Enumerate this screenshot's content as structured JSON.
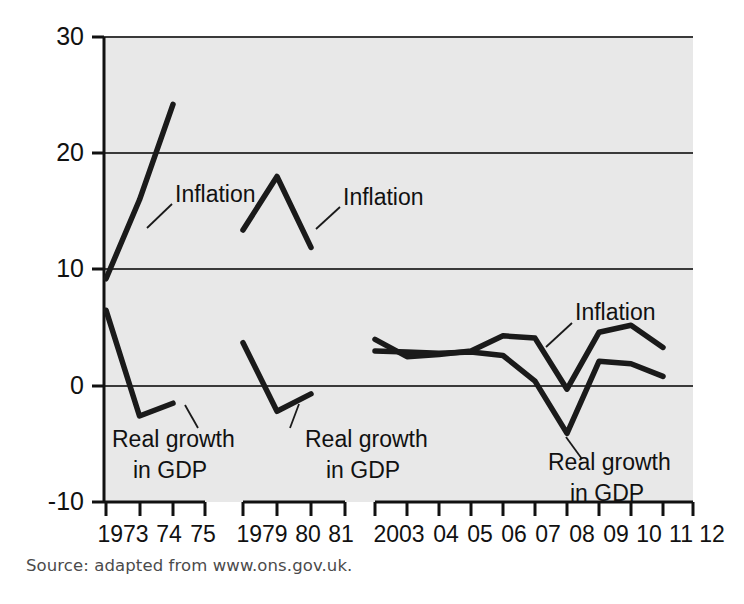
{
  "chart_data": {
    "type": "line",
    "title": "",
    "subtitle": "",
    "xlabel": "",
    "ylabel": "",
    "ylim": [
      -10,
      30
    ],
    "yticks": [
      -10,
      0,
      10,
      20,
      30
    ],
    "ytick_labels": [
      "-10",
      "0",
      "10",
      "20",
      "30"
    ],
    "grid": true,
    "gridlines_y": [
      0,
      10,
      20,
      30
    ],
    "legend": "inline annotations",
    "legend_position": "inline",
    "plot_background": "#e8e8e8",
    "line_color": "#1a1a1a",
    "categories": [
      "1973",
      "74",
      "75",
      "1979",
      "80",
      "81",
      "2003",
      "04",
      "05",
      "06",
      "07",
      "08",
      "09",
      "10",
      "11",
      "12"
    ],
    "segments": [
      {
        "name": "1973-75",
        "x": [
          "1973",
          "74",
          "75"
        ],
        "series": [
          {
            "name": "Inflation",
            "values": [
              9.2,
              16.0,
              24.2
            ]
          },
          {
            "name": "Real growth in GDP",
            "values": [
              6.5,
              -2.6,
              -1.5
            ]
          }
        ]
      },
      {
        "name": "1979-81",
        "x": [
          "1979",
          "80",
          "81"
        ],
        "series": [
          {
            "name": "Inflation",
            "values": [
              13.4,
              18.0,
              11.9
            ]
          },
          {
            "name": "Real growth in GDP",
            "values": [
              3.7,
              -2.2,
              -0.7
            ]
          }
        ]
      },
      {
        "name": "2003-12",
        "x": [
          "2003",
          "04",
          "05",
          "06",
          "07",
          "08",
          "09",
          "10",
          "11",
          "12"
        ],
        "series": [
          {
            "name": "Inflation",
            "values": [
              4.0,
              2.5,
              2.7,
              3.0,
              4.3,
              4.1,
              -0.3,
              4.6,
              5.2,
              3.3
            ]
          },
          {
            "name": "Real growth in GDP",
            "values": [
              3.0,
              2.9,
              2.8,
              2.9,
              2.6,
              0.4,
              -4.1,
              2.1,
              1.9,
              0.8
            ]
          }
        ]
      }
    ],
    "annotations": [
      {
        "text": "Inflation",
        "series": "Inflation",
        "segment": "1973-75"
      },
      {
        "text": "Inflation",
        "series": "Inflation",
        "segment": "1979-81"
      },
      {
        "text": "Inflation",
        "series": "Inflation",
        "segment": "2003-12"
      },
      {
        "text": "Real growth",
        "series": "Real growth in GDP",
        "segment": "1973-75"
      },
      {
        "text": "in GDP",
        "series": "Real growth in GDP",
        "segment": "1973-75"
      },
      {
        "text": "Real growth",
        "series": "Real growth in GDP",
        "segment": "1979-81"
      },
      {
        "text": "in GDP",
        "series": "Real growth in GDP",
        "segment": "1979-81"
      },
      {
        "text": "Real growth",
        "series": "Real growth in GDP",
        "segment": "2003-12"
      },
      {
        "text": "in GDP",
        "series": "Real growth in GDP",
        "segment": "2003-12"
      }
    ]
  },
  "axis": {
    "y_labels": {
      "t30": "30",
      "t20": "20",
      "t10": "10",
      "t0": "0",
      "tm10": "-10"
    },
    "x_labels": {
      "x1973": "1973",
      "x74": "74",
      "x75": "75",
      "x1979": "1979",
      "x80": "80",
      "x81": "81",
      "x2003": "2003",
      "x04": "04",
      "x05": "05",
      "x06": "06",
      "x07": "07",
      "x08": "08",
      "x09": "09",
      "x10": "10",
      "x11": "11",
      "x12": "12"
    }
  },
  "labels": {
    "inflation_1": "Inflation",
    "inflation_2": "Inflation",
    "inflation_3": "Inflation",
    "gdp_1_line1": "Real growth",
    "gdp_1_line2": "in GDP",
    "gdp_2_line1": "Real growth",
    "gdp_2_line2": "in GDP",
    "gdp_3_line1": "Real growth",
    "gdp_3_line2": "in GDP"
  },
  "footer": {
    "source": "Source: adapted from www.ons.gov.uk."
  }
}
